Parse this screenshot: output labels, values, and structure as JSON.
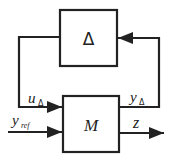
{
  "diagram": {
    "type": "block-diagram",
    "blocks": [
      {
        "id": "delta",
        "label": "Δ"
      },
      {
        "id": "m",
        "label": "M"
      }
    ],
    "signals": {
      "u_delta": {
        "base": "u",
        "sub": "Δ"
      },
      "y_delta": {
        "base": "y",
        "sub": "Δ"
      },
      "y_ref": {
        "base": "y",
        "sub": "ref"
      },
      "z": {
        "base": "z"
      }
    },
    "colors": {
      "line": "#222222",
      "background": "#ffffff"
    }
  }
}
